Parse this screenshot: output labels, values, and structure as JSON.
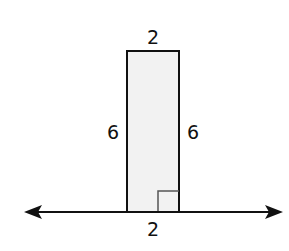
{
  "diagram": {
    "type": "rectangle-on-line",
    "labels": {
      "top": "2",
      "left": "6",
      "right": "6",
      "bottom": "2"
    },
    "colors": {
      "stroke": "#111111",
      "fill": "#f2f2f2",
      "marker": "#555555"
    },
    "right_angle_marker": true,
    "line_arrows": [
      "left",
      "right"
    ]
  }
}
